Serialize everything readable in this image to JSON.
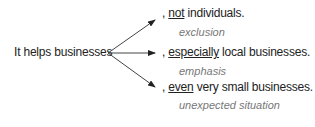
{
  "stem": "It helps businesses",
  "branches": [
    {
      "prefix": ", ",
      "keyword": "not",
      "rest": " individuals.",
      "label": "exclusion"
    },
    {
      "prefix": ", ",
      "keyword": "especially",
      "rest": " local businesses.",
      "label": "emphasis"
    },
    {
      "prefix": ", ",
      "keyword": "even",
      "rest": " very small businesses.",
      "label": "unexpected situation"
    }
  ]
}
